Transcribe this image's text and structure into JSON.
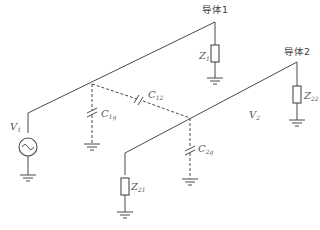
{
  "diagram": {
    "type": "circuit",
    "conductors": [
      {
        "id": "conductor-1",
        "label": "导体1"
      },
      {
        "id": "conductor-2",
        "label": "导体2"
      }
    ],
    "components": {
      "Z1": {
        "main": "Z",
        "sub": "1"
      },
      "Z22": {
        "main": "Z",
        "sub": "22"
      },
      "Z21": {
        "main": "Z",
        "sub": "21"
      },
      "C12": {
        "main": "C",
        "sub": "12"
      },
      "C1g": {
        "main": "C",
        "sub": "1g"
      },
      "C2g": {
        "main": "C",
        "sub": "2g"
      },
      "V1": {
        "main": "V",
        "sub": "1"
      },
      "V2": {
        "main": "V",
        "sub": "2"
      }
    },
    "colors": {
      "line": "#4a4a4a",
      "text": "#555555",
      "background": "#ffffff"
    }
  }
}
